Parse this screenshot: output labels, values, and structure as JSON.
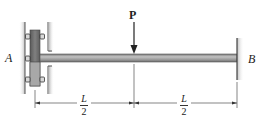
{
  "figure": {
    "labels": {
      "support_left": "A",
      "support_right": "B",
      "load": "P"
    },
    "dimensions": [
      {
        "numerator": "L",
        "denominator": "2"
      },
      {
        "numerator": "L",
        "denominator": "2"
      }
    ],
    "colors": {
      "beam": "#8a8a8a",
      "beam_highlight": "#b5b5b5",
      "collar": "#6b6b6b",
      "wall_shade": "#cfcfcf",
      "line": "#333333"
    }
  }
}
